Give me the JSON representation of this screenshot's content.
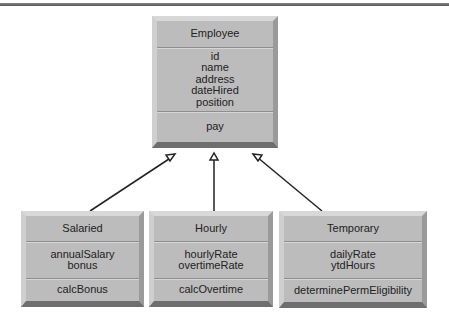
{
  "diagram": {
    "type": "UML class inheritance",
    "parent": {
      "name": "Employee",
      "attributes": [
        "id",
        "name",
        "address",
        "dateHired",
        "position"
      ],
      "methods": [
        "pay"
      ]
    },
    "children": [
      {
        "name": "Salaried",
        "attributes": [
          "annualSalary",
          "bonus"
        ],
        "methods": [
          "calcBonus"
        ]
      },
      {
        "name": "Hourly",
        "attributes": [
          "hourlyRate",
          "overtimeRate"
        ],
        "methods": [
          "calcOvertime"
        ]
      },
      {
        "name": "Temporary",
        "attributes": [
          "dailyRate",
          "ytdHours"
        ],
        "methods": [
          "determinePermEligibility"
        ]
      }
    ]
  }
}
